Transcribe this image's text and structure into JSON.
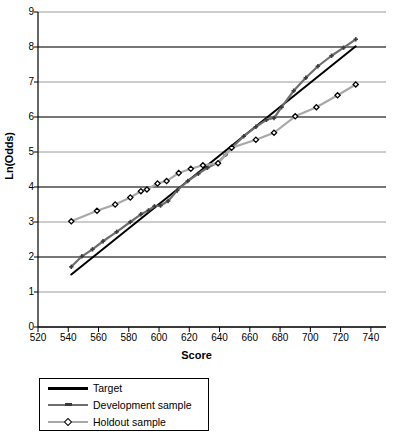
{
  "chart_data": {
    "type": "line",
    "title": "",
    "xlabel": "Score",
    "ylabel": "Ln(Odds)",
    "xlim": [
      520,
      750
    ],
    "ylim": [
      0,
      9
    ],
    "xticks": [
      520,
      540,
      560,
      580,
      600,
      620,
      640,
      660,
      680,
      700,
      720,
      740
    ],
    "yticks": [
      0,
      1,
      2,
      3,
      4,
      5,
      6,
      7,
      8,
      9
    ],
    "grid": "horizontal",
    "legend_position": "below-plot",
    "series": [
      {
        "name": "Target",
        "color": "#000000",
        "marker": "none",
        "points": [
          [
            542,
            1.5
          ],
          [
            730,
            8.02
          ]
        ]
      },
      {
        "name": "Development sample",
        "color": "#6e6e6e",
        "marker": "plus",
        "points": [
          [
            542,
            1.72
          ],
          [
            549,
            2.02
          ],
          [
            556,
            2.22
          ],
          [
            563,
            2.45
          ],
          [
            572,
            2.72
          ],
          [
            581,
            3.0
          ],
          [
            588,
            3.22
          ],
          [
            593,
            3.33
          ],
          [
            597,
            3.45
          ],
          [
            601,
            3.47
          ],
          [
            606,
            3.6
          ],
          [
            612,
            3.9
          ],
          [
            619,
            4.17
          ],
          [
            626,
            4.38
          ],
          [
            632,
            4.55
          ],
          [
            639,
            4.7
          ],
          [
            644,
            4.92
          ],
          [
            648,
            5.12
          ],
          [
            656,
            5.45
          ],
          [
            664,
            5.72
          ],
          [
            671,
            5.92
          ],
          [
            676,
            5.97
          ],
          [
            681,
            6.28
          ],
          [
            689,
            6.75
          ],
          [
            697,
            7.12
          ],
          [
            705,
            7.45
          ],
          [
            714,
            7.75
          ],
          [
            722,
            7.98
          ],
          [
            730,
            8.22
          ]
        ]
      },
      {
        "name": "Holdout sample",
        "color": "#a8a8a8",
        "marker": "diamond",
        "points": [
          [
            542,
            3.02
          ],
          [
            559,
            3.32
          ],
          [
            571,
            3.5
          ],
          [
            581,
            3.7
          ],
          [
            588,
            3.88
          ],
          [
            592,
            3.93
          ],
          [
            599,
            4.1
          ],
          [
            605,
            4.17
          ],
          [
            613,
            4.4
          ],
          [
            621,
            4.52
          ],
          [
            629,
            4.62
          ],
          [
            639,
            4.68
          ],
          [
            648,
            5.12
          ],
          [
            664,
            5.35
          ],
          [
            676,
            5.55
          ],
          [
            690,
            6.02
          ],
          [
            704,
            6.28
          ],
          [
            718,
            6.62
          ],
          [
            730,
            6.93
          ]
        ]
      }
    ]
  },
  "legend": {
    "items": [
      {
        "label": "Target"
      },
      {
        "label": "Development sample"
      },
      {
        "label": "Holdout sample"
      }
    ]
  }
}
